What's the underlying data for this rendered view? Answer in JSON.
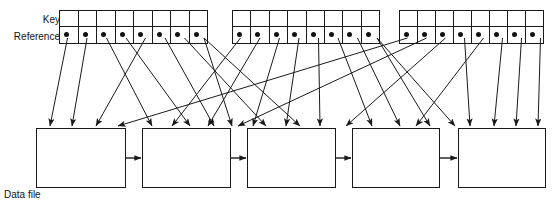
{
  "diagram": {
    "labels": {
      "key": "Key",
      "reference": "Reference",
      "data_file": "Data file"
    },
    "colors": {
      "stroke": "#1a1a1a",
      "dot": "#111111",
      "background": "#ffffff",
      "text": "#111111"
    },
    "index_blocks": [
      {
        "name": "index-block-1",
        "x": 60,
        "y": 10,
        "width": 156,
        "height": 34,
        "cells": 8,
        "cell_width": 19.5,
        "key_row_label": "Key",
        "reference_row_label": "Reference"
      },
      {
        "name": "index-block-2",
        "x": 233,
        "y": 10,
        "width": 155,
        "height": 34,
        "cells": 8,
        "cell_width": 19.4,
        "key_row_label": "Key",
        "reference_row_label": "Reference"
      },
      {
        "name": "index-block-3",
        "x": 400,
        "y": 10,
        "width": 152,
        "height": 34,
        "cells": 8,
        "cell_width": 19.0,
        "key_row_label": "Key",
        "reference_row_label": "Reference"
      }
    ],
    "data_boxes": [
      {
        "name": "data-box-1",
        "x": 36,
        "y": 128,
        "width": 90,
        "height": 60
      },
      {
        "name": "data-box-2",
        "x": 142,
        "y": 128,
        "width": 89,
        "height": 60
      },
      {
        "name": "data-box-3",
        "x": 247,
        "y": 128,
        "width": 89,
        "height": 60
      },
      {
        "name": "data-box-4",
        "x": 352,
        "y": 128,
        "width": 88,
        "height": 60
      },
      {
        "name": "data-box-5",
        "x": 458,
        "y": 128,
        "width": 88,
        "height": 60
      }
    ],
    "chain_arrows": [
      {
        "name": "chain-arrow-1-2",
        "x1": 126,
        "y": 158,
        "x2": 142
      },
      {
        "name": "chain-arrow-2-3",
        "x1": 231,
        "y": 158,
        "x2": 247
      },
      {
        "name": "chain-arrow-3-4",
        "x1": 336,
        "y": 158,
        "x2": 352
      },
      {
        "name": "chain-arrow-4-5",
        "x1": 440,
        "y": 158,
        "x2": 458
      }
    ],
    "reference_dots": [
      {
        "name": "ref-dot-1-1",
        "x": 67.5,
        "y": 38
      },
      {
        "name": "ref-dot-1-2",
        "x": 87,
        "y": 38
      },
      {
        "name": "ref-dot-1-3",
        "x": 106.5,
        "y": 38
      },
      {
        "name": "ref-dot-1-4",
        "x": 126,
        "y": 38
      },
      {
        "name": "ref-dot-1-5",
        "x": 145.5,
        "y": 38
      },
      {
        "name": "ref-dot-1-6",
        "x": 165,
        "y": 38
      },
      {
        "name": "ref-dot-1-7",
        "x": 184.5,
        "y": 38
      },
      {
        "name": "ref-dot-1-8",
        "x": 204,
        "y": 38
      },
      {
        "name": "ref-dot-2-1",
        "x": 240.5,
        "y": 38
      },
      {
        "name": "ref-dot-2-2",
        "x": 260,
        "y": 38
      },
      {
        "name": "ref-dot-2-3",
        "x": 279.5,
        "y": 38
      },
      {
        "name": "ref-dot-2-4",
        "x": 299,
        "y": 38
      },
      {
        "name": "ref-dot-2-5",
        "x": 318.5,
        "y": 38
      },
      {
        "name": "ref-dot-2-6",
        "x": 338,
        "y": 38
      },
      {
        "name": "ref-dot-2-7",
        "x": 357.5,
        "y": 38
      },
      {
        "name": "ref-dot-2-8",
        "x": 377,
        "y": 38
      },
      {
        "name": "ref-dot-3-1",
        "x": 407.5,
        "y": 38
      },
      {
        "name": "ref-dot-3-2",
        "x": 426.5,
        "y": 38
      },
      {
        "name": "ref-dot-3-3",
        "x": 445.5,
        "y": 38
      },
      {
        "name": "ref-dot-3-4",
        "x": 464.5,
        "y": 38
      },
      {
        "name": "ref-dot-3-5",
        "x": 483.5,
        "y": 38
      },
      {
        "name": "ref-dot-3-6",
        "x": 502.5,
        "y": 38
      },
      {
        "name": "ref-dot-3-7",
        "x": 521.5,
        "y": 38
      },
      {
        "name": "ref-dot-3-8",
        "x": 540.5,
        "y": 38
      }
    ],
    "pointer_links": [
      {
        "name": "pointer-1-1",
        "from": [
          67.5,
          38
        ],
        "to": [
          50,
          126
        ]
      },
      {
        "name": "pointer-1-2",
        "from": [
          87,
          38
        ],
        "to": [
          72,
          126
        ]
      },
      {
        "name": "pointer-1-3",
        "from": [
          106.5,
          38
        ],
        "to": [
          152,
          126
        ]
      },
      {
        "name": "pointer-1-4",
        "from": [
          126,
          38
        ],
        "to": [
          190,
          126
        ]
      },
      {
        "name": "pointer-1-5",
        "from": [
          145.5,
          38
        ],
        "to": [
          96,
          126
        ]
      },
      {
        "name": "pointer-1-6",
        "from": [
          165,
          38
        ],
        "to": [
          214,
          126
        ]
      },
      {
        "name": "pointer-1-7",
        "from": [
          184.5,
          38
        ],
        "to": [
          266,
          126
        ]
      },
      {
        "name": "pointer-1-8",
        "from": [
          204,
          38
        ],
        "to": [
          300,
          126
        ]
      },
      {
        "name": "pointer-2-1",
        "from": [
          240.5,
          38
        ],
        "to": [
          172,
          126
        ]
      },
      {
        "name": "pointer-2-2",
        "from": [
          260,
          38
        ],
        "to": [
          208,
          126
        ]
      },
      {
        "name": "pointer-2-3",
        "from": [
          279.5,
          38
        ],
        "to": [
          253,
          126
        ]
      },
      {
        "name": "pointer-2-4",
        "from": [
          299,
          38
        ],
        "to": [
          286,
          126
        ]
      },
      {
        "name": "pointer-2-5",
        "from": [
          318.5,
          38
        ],
        "to": [
          320,
          126
        ]
      },
      {
        "name": "pointer-2-6",
        "from": [
          338,
          38
        ],
        "to": [
          372,
          126
        ]
      },
      {
        "name": "pointer-2-7",
        "from": [
          357.5,
          38
        ],
        "to": [
          400,
          126
        ]
      },
      {
        "name": "pointer-2-8",
        "from": [
          377,
          38
        ],
        "to": [
          430,
          126
        ]
      },
      {
        "name": "pointer-3-1",
        "from": [
          407.5,
          38
        ],
        "to": [
          118,
          126
        ]
      },
      {
        "name": "pointer-3-2",
        "from": [
          426.5,
          38
        ],
        "to": [
          238,
          126
        ]
      },
      {
        "name": "pointer-3-3",
        "from": [
          445.5,
          38
        ],
        "to": [
          346,
          126
        ]
      },
      {
        "name": "pointer-3-4",
        "from": [
          464.5,
          38
        ],
        "to": [
          470,
          126
        ]
      },
      {
        "name": "pointer-3-5",
        "from": [
          483.5,
          38
        ],
        "to": [
          416,
          126
        ]
      },
      {
        "name": "pointer-3-6",
        "from": [
          502.5,
          38
        ],
        "to": [
          494,
          126
        ]
      },
      {
        "name": "pointer-3-7",
        "from": [
          521.5,
          38
        ],
        "to": [
          516,
          126
        ]
      },
      {
        "name": "pointer-3-8",
        "from": [
          540.5,
          38
        ],
        "to": [
          538,
          126
        ]
      },
      {
        "name": "pointer-cross-a",
        "from": [
          204,
          38
        ],
        "to": [
          232,
          126
        ]
      },
      {
        "name": "pointer-cross-b",
        "from": [
          377,
          38
        ],
        "to": [
          455,
          126
        ]
      }
    ]
  }
}
